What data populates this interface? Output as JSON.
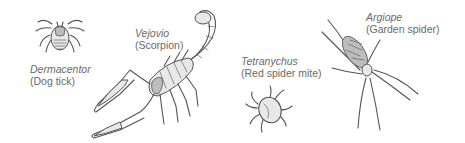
{
  "figure": {
    "background": "#ffffff",
    "text_color": "#6a6a6a",
    "specimens": [
      {
        "id": "dermacentor",
        "genus": "Dermacentor",
        "common_name": "(Dog tick)"
      },
      {
        "id": "vejovis",
        "genus": "Vejovio",
        "common_name": "(Scorpion)"
      },
      {
        "id": "tetranychus",
        "genus": "Tetranychus",
        "common_name": "(Red spider mite)"
      },
      {
        "id": "argiope",
        "genus": "Argiope",
        "common_name": "(Garden spider)"
      }
    ]
  }
}
